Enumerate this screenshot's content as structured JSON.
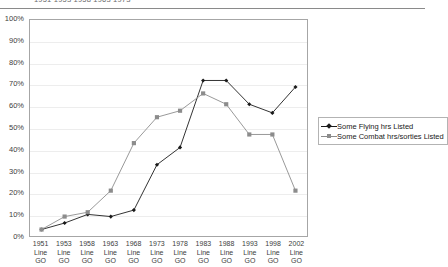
{
  "page": {
    "clipped_header_text": "1951   1953  1958   1963      1973"
  },
  "chart_data": {
    "type": "line",
    "title": "",
    "xlabel": "",
    "ylabel": "",
    "ylim": [
      0,
      100
    ],
    "y_unit": "%",
    "grid": true,
    "legend_position": "right",
    "categories": [
      "1951 Line GO",
      "1953 Line GO",
      "1958 Line GO",
      "1963 Line GO",
      "1968 Line GO",
      "1973 Line GO",
      "1978 Line GO",
      "1983 Line GO",
      "1988 Line GO",
      "1993 Line GO",
      "1998 Line GO",
      "2002 Line GO"
    ],
    "category_lines": [
      [
        "1951",
        "Line",
        "GO"
      ],
      [
        "1953",
        "Line",
        "GO"
      ],
      [
        "1958",
        "Line",
        "GO"
      ],
      [
        "1963",
        "Line",
        "GO"
      ],
      [
        "1968",
        "Line",
        "GO"
      ],
      [
        "1973",
        "Line",
        "GO"
      ],
      [
        "1978",
        "Line",
        "GO"
      ],
      [
        "1983",
        "Line",
        "GO"
      ],
      [
        "1988",
        "Line",
        "GO"
      ],
      [
        "1993",
        "Line",
        "GO"
      ],
      [
        "1998",
        "Line",
        "GO"
      ],
      [
        "2002",
        "Line",
        "GO"
      ]
    ],
    "y_ticks": [
      "0%",
      "10%",
      "20%",
      "30%",
      "40%",
      "50%",
      "60%",
      "70%",
      "80%",
      "90%",
      "100%"
    ],
    "y_tick_values": [
      0,
      10,
      20,
      30,
      40,
      50,
      60,
      70,
      80,
      90,
      100
    ],
    "series": [
      {
        "name": "Some Flying hrs Listed",
        "color": "#1a1a1a",
        "marker": "diamond",
        "values": [
          3,
          6,
          10,
          9,
          12,
          33,
          41,
          72,
          72,
          61,
          57,
          69
        ]
      },
      {
        "name": "Some Combat hrs/sorties Listed",
        "color": "#8c8c8c",
        "marker": "square",
        "values": [
          3,
          9,
          11,
          21,
          43,
          55,
          58,
          66,
          61,
          47,
          47,
          21
        ]
      }
    ]
  },
  "legend": {
    "entries": [
      {
        "label": "Some Flying hrs Listed"
      },
      {
        "label": "Some Combat hrs/sorties Listed"
      }
    ]
  }
}
